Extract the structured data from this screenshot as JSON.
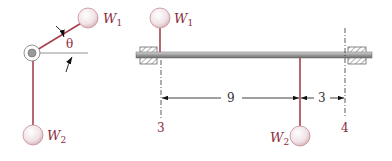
{
  "colors": {
    "rod": "#a8404d",
    "ball_fill": "#f2e8ea",
    "ball_stroke": "#c98a95",
    "shaft": "#9a9a9a",
    "label": "#8b2b3a",
    "dim": "#222222"
  },
  "end_view": {
    "pivot": {
      "x": 32,
      "y": 53
    },
    "w1": {
      "label": "W",
      "sub": "1",
      "x": 88,
      "y": 18
    },
    "w2": {
      "label": "W",
      "sub": "2",
      "x": 33,
      "y": 135
    },
    "angle_label": "θ"
  },
  "side_view": {
    "w1": {
      "label": "W",
      "sub": "1",
      "x": 160,
      "y": 18
    },
    "w2": {
      "label": "W",
      "sub": "2",
      "x": 300,
      "y": 136
    },
    "station_left": "3",
    "station_right": "4",
    "dim_left": "9",
    "dim_right": "3"
  }
}
